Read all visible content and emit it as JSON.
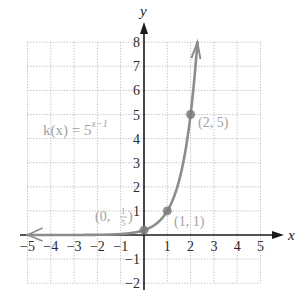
{
  "chart_data": {
    "type": "line",
    "title": "",
    "function_label": "k(x) = 5^(x−1)",
    "function_label_parts": {
      "lhs": "k(x) = 5",
      "exponent": "x−1"
    },
    "xlabel": "x",
    "ylabel": "y",
    "xlim": [
      -5,
      5
    ],
    "ylim": [
      -2,
      8
    ],
    "grid": true,
    "x_ticks": [
      -5,
      -4,
      -3,
      -2,
      -1,
      1,
      2,
      3,
      4,
      5
    ],
    "y_ticks": [
      -2,
      -1,
      1,
      2,
      3,
      4,
      5,
      6,
      7,
      8
    ],
    "x_tick_labels": [
      "−5",
      "−4",
      "−3",
      "−2",
      "−1",
      "1",
      "2",
      "3",
      "4",
      "5"
    ],
    "y_tick_labels": [
      "−2",
      "−1",
      "1",
      "2",
      "3",
      "4",
      "5",
      "6",
      "7",
      "8"
    ],
    "series": [
      {
        "name": "k(x) = 5^(x−1)",
        "x": [
          -5,
          -4,
          -3,
          -2,
          -1,
          0,
          1,
          2,
          2.29
        ],
        "y": [
          6e-05,
          0.0016,
          0.008,
          0.04,
          0.04,
          0.2,
          1,
          5,
          8
        ],
        "color": "#8c8c8c"
      }
    ],
    "marked_points": [
      {
        "x": 0,
        "y": 0.2,
        "label": "(0, 1/5)",
        "label_main": "(0, ",
        "label_num": "1",
        "label_den": "5",
        "label_end": ")"
      },
      {
        "x": 1,
        "y": 1,
        "label": "(1, 1)"
      },
      {
        "x": 2,
        "y": 5,
        "label": "(2, 5)"
      }
    ],
    "colors": {
      "curve": "#8c8c8c",
      "points": "#7a7a7a",
      "labels": "#a2a2a2",
      "axes": "#1a1a1a",
      "grid": "#b4b4b4"
    }
  }
}
